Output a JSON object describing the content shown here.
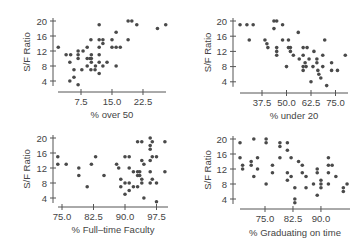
{
  "figure": {
    "width": 359,
    "height": 249,
    "point_color": "#4a4a4a",
    "axis_color": "#555555",
    "text_color": "#444444"
  },
  "chart_data": [
    {
      "type": "scatter",
      "title": "",
      "xlabel": "% over 50",
      "ylabel": "S/F Ratio",
      "xticks": [
        7.5,
        15.0,
        22.5
      ],
      "xtick_labels": [
        "7.5",
        "15.0",
        "22.5"
      ],
      "yticks": [
        4,
        8,
        12,
        16,
        20
      ],
      "ytick_labels": [
        "4",
        "8",
        "12",
        "16",
        "20"
      ],
      "xlim": [
        0.6,
        28.8
      ],
      "ylim": [
        2.5,
        20.5
      ],
      "grid": false,
      "layout": {
        "panel": "top-left",
        "x0": 58,
        "x1": 166,
        "yaxis_x": 53,
        "xaxis_y": 92,
        "y_top": 18,
        "px_x_ref": [
          81,
          7.5
        ],
        "px_per_x": 4.133,
        "px_y_ref": [
          21,
          20
        ],
        "px_per_y": 3.75,
        "ylabel_x": 30,
        "xlabel_y": 118
      },
      "points": [
        [
          2,
          13
        ],
        [
          3.9,
          11
        ],
        [
          5,
          11
        ],
        [
          4.8,
          9
        ],
        [
          6.8,
          12
        ],
        [
          6.8,
          11
        ],
        [
          6.8,
          10
        ],
        [
          8,
          12
        ],
        [
          5.8,
          7
        ],
        [
          4.8,
          4
        ],
        [
          5.8,
          5
        ],
        [
          6.8,
          3
        ],
        [
          7.7,
          7
        ],
        [
          9,
          10
        ],
        [
          9,
          8
        ],
        [
          9.7,
          10
        ],
        [
          10,
          11
        ],
        [
          10,
          10
        ],
        [
          10,
          9
        ],
        [
          9.9,
          7
        ],
        [
          10.9,
          7
        ],
        [
          11,
          8
        ],
        [
          9.9,
          15
        ],
        [
          9,
          13
        ],
        [
          11.9,
          19
        ],
        [
          11.9,
          15
        ],
        [
          11.9,
          13
        ],
        [
          11.9,
          11
        ],
        [
          11.9,
          9
        ],
        [
          11.9,
          6
        ],
        [
          12.8,
          15
        ],
        [
          12.8,
          14
        ],
        [
          12.8,
          8
        ],
        [
          13.8,
          9
        ],
        [
          15,
          15
        ],
        [
          15,
          13
        ],
        [
          16,
          17
        ],
        [
          16,
          13
        ],
        [
          16,
          8
        ],
        [
          17,
          13
        ],
        [
          18.9,
          15
        ],
        [
          18.9,
          20
        ],
        [
          19.8,
          20
        ],
        [
          21,
          19
        ],
        [
          26,
          18
        ],
        [
          28,
          19
        ]
      ]
    },
    {
      "type": "scatter",
      "title": "",
      "xlabel": "% under 20",
      "ylabel": "S/F Ratio",
      "xticks": [
        37.5,
        50.0,
        62.5,
        75.0
      ],
      "xtick_labels": [
        "37.5",
        "50.0",
        "62.5",
        "75.0"
      ],
      "yticks": [
        4,
        8,
        12,
        16,
        20
      ],
      "ytick_labels": [
        "4",
        "8",
        "12",
        "16",
        "20"
      ],
      "xlim": [
        25,
        82
      ],
      "ylim": [
        2.5,
        20.5
      ],
      "grid": false,
      "layout": {
        "panel": "top-right",
        "x0": 240,
        "x1": 348,
        "yaxis_x": 233,
        "xaxis_y": 93,
        "y_top": 18,
        "px_x_ref": [
          262,
          37.5
        ],
        "px_per_x": 1.96,
        "px_y_ref": [
          21,
          20
        ],
        "px_per_y": 3.8,
        "ylabel_x": 211,
        "xlabel_y": 119
      },
      "points": [
        [
          26.3,
          19
        ],
        [
          29.8,
          19
        ],
        [
          33,
          19
        ],
        [
          31,
          15
        ],
        [
          39,
          15
        ],
        [
          40,
          14
        ],
        [
          40.5,
          13
        ],
        [
          43.6,
          20
        ],
        [
          45,
          20
        ],
        [
          43.6,
          18
        ],
        [
          45,
          13
        ],
        [
          45,
          12
        ],
        [
          45,
          11
        ],
        [
          48,
          19
        ],
        [
          48,
          15
        ],
        [
          50,
          8
        ],
        [
          51,
          15
        ],
        [
          51,
          13
        ],
        [
          52,
          13
        ],
        [
          52,
          12
        ],
        [
          53.5,
          11
        ],
        [
          56,
          17
        ],
        [
          56.5,
          10
        ],
        [
          58.5,
          13
        ],
        [
          60.5,
          13
        ],
        [
          58.5,
          11
        ],
        [
          58.5,
          8
        ],
        [
          58.5,
          7
        ],
        [
          59.5,
          9
        ],
        [
          60,
          8
        ],
        [
          61.5,
          10
        ],
        [
          62.5,
          4
        ],
        [
          63.5,
          8
        ],
        [
          64,
          12
        ],
        [
          65.5,
          10
        ],
        [
          65.5,
          9
        ],
        [
          66,
          7
        ],
        [
          66.5,
          6
        ],
        [
          67.5,
          5
        ],
        [
          68.5,
          11
        ],
        [
          68.5,
          8
        ],
        [
          69.5,
          15
        ],
        [
          70.5,
          3
        ],
        [
          73,
          9
        ],
        [
          73,
          7
        ],
        [
          76,
          7
        ],
        [
          80,
          11
        ]
      ]
    },
    {
      "type": "scatter",
      "title": "",
      "xlabel": "% Full–time Faculty",
      "ylabel": "S/F Ratio",
      "xticks": [
        75.0,
        82.5,
        90.0,
        97.5
      ],
      "xtick_labels": [
        "75.0",
        "82.5",
        "90.0",
        "97.5"
      ],
      "yticks": [
        4,
        8,
        12,
        16,
        20
      ],
      "ytick_labels": [
        "4",
        "8",
        "12",
        "16",
        "20"
      ],
      "xlim": [
        73,
        100
      ],
      "ylim": [
        2.5,
        20.5
      ],
      "grid": false,
      "layout": {
        "panel": "bottom-left",
        "x0": 58,
        "x1": 168,
        "yaxis_x": 53,
        "xaxis_y": 207,
        "y_top": 135,
        "px_x_ref": [
          62,
          75
        ],
        "px_per_x": 4.2,
        "px_y_ref": [
          138,
          20
        ],
        "px_per_y": 3.75,
        "ylabel_x": 30,
        "xlabel_y": 233
      },
      "points": [
        [
          74,
          15
        ],
        [
          74,
          13
        ],
        [
          76,
          13
        ],
        [
          79,
          12
        ],
        [
          79,
          10
        ],
        [
          81,
          7
        ],
        [
          82,
          13
        ],
        [
          83,
          15
        ],
        [
          85,
          10
        ],
        [
          88,
          13
        ],
        [
          88.5,
          12
        ],
        [
          89,
          9
        ],
        [
          89,
          7
        ],
        [
          90,
          15
        ],
        [
          91,
          15
        ],
        [
          90,
          5
        ],
        [
          90,
          8
        ],
        [
          91,
          6
        ],
        [
          91,
          8
        ],
        [
          91,
          12
        ],
        [
          92,
          7
        ],
        [
          92,
          11
        ],
        [
          93,
          7
        ],
        [
          93,
          10
        ],
        [
          93,
          11
        ],
        [
          93,
          19
        ],
        [
          94,
          19
        ],
        [
          93.5,
          10
        ],
        [
          93.5,
          11
        ],
        [
          94,
          9
        ],
        [
          94,
          8
        ],
        [
          94,
          14
        ],
        [
          94.5,
          4
        ],
        [
          94.5,
          13
        ],
        [
          96,
          20
        ],
        [
          96,
          18
        ],
        [
          96,
          17
        ],
        [
          96,
          14
        ],
        [
          96,
          11
        ],
        [
          96,
          8
        ],
        [
          96.5,
          19
        ],
        [
          96.5,
          15
        ],
        [
          96.5,
          9
        ],
        [
          97.5,
          15
        ],
        [
          97.5,
          8
        ],
        [
          97.5,
          3
        ],
        [
          99.5,
          19
        ],
        [
          99.5,
          11
        ]
      ]
    },
    {
      "type": "scatter",
      "title": "",
      "xlabel": "% Graduating on time",
      "ylabel": "S/F Ratio",
      "xticks": [
        75.0,
        82.5,
        90.0
      ],
      "xtick_labels": [
        "75.0",
        "82.5",
        "90.0"
      ],
      "yticks": [
        4,
        8,
        12,
        16,
        20
      ],
      "ytick_labels": [
        "4",
        "8",
        "12",
        "16",
        "20"
      ],
      "xlim": [
        67.5,
        98
      ],
      "ylim": [
        2.5,
        20.5
      ],
      "grid": false,
      "layout": {
        "panel": "bottom-right",
        "x0": 240,
        "x1": 350,
        "yaxis_x": 233,
        "xaxis_y": 209,
        "y_top": 136,
        "px_x_ref": [
          265,
          75
        ],
        "px_per_x": 3.73,
        "px_y_ref": [
          139,
          20
        ],
        "px_per_y": 3.75,
        "ylabel_x": 211,
        "xlabel_y": 236
      },
      "points": [
        [
          68.3,
          19
        ],
        [
          68.3,
          15
        ],
        [
          69,
          13
        ],
        [
          69,
          12
        ],
        [
          71.3,
          14
        ],
        [
          71.3,
          13
        ],
        [
          72,
          20
        ],
        [
          72,
          10
        ],
        [
          73,
          15
        ],
        [
          73,
          12
        ],
        [
          75.3,
          20
        ],
        [
          75.3,
          19
        ],
        [
          75.3,
          8
        ],
        [
          77,
          13
        ],
        [
          77,
          11
        ],
        [
          79,
          19
        ],
        [
          79,
          18
        ],
        [
          79,
          15
        ],
        [
          81,
          19
        ],
        [
          81,
          17
        ],
        [
          81,
          11
        ],
        [
          81,
          9
        ],
        [
          82,
          15
        ],
        [
          82,
          10
        ],
        [
          83,
          7
        ],
        [
          83,
          4
        ],
        [
          83,
          3
        ],
        [
          84,
          14
        ],
        [
          85,
          13
        ],
        [
          85,
          11
        ],
        [
          86,
          10
        ],
        [
          86,
          7
        ],
        [
          88,
          8
        ],
        [
          89,
          12
        ],
        [
          89,
          11
        ],
        [
          89,
          5
        ],
        [
          90,
          9
        ],
        [
          90,
          8
        ],
        [
          90,
          7
        ],
        [
          92,
          15
        ],
        [
          92,
          13
        ],
        [
          92,
          11
        ],
        [
          92,
          8
        ],
        [
          93,
          13
        ],
        [
          94,
          10
        ],
        [
          96,
          7
        ],
        [
          96,
          6
        ],
        [
          97,
          8
        ]
      ]
    }
  ]
}
